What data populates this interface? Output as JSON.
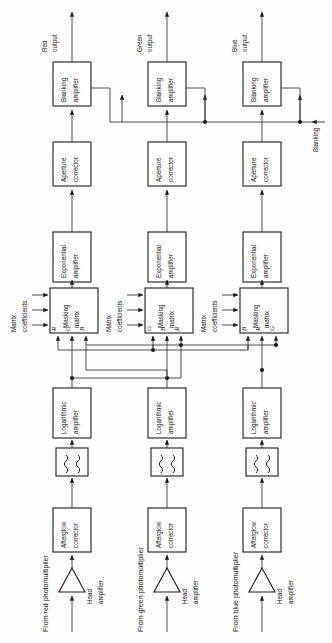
{
  "diagram": {
    "orientation": "rotated-90-ccw",
    "outputs": [
      {
        "id": "red",
        "label_line1": "Red",
        "label_line2": "output"
      },
      {
        "id": "green",
        "label_line1": "Green",
        "label_line2": "output"
      },
      {
        "id": "blue",
        "label_line1": "Blue",
        "label_line2": "output"
      }
    ],
    "blanking_label": "Blanking",
    "blocks": {
      "blanking_amplifier": {
        "line1": "Blanking",
        "line2": "amplifier"
      },
      "aperture_corrector": {
        "line1": "Aperture",
        "line2": "corrector"
      },
      "exponential_amplifier": {
        "line1": "Exponential",
        "line2": "amplifier"
      },
      "masking_matrix": {
        "line1": "Masking",
        "line2": "matrix"
      },
      "logarithmic_amplifier": {
        "line1": "Logarithmic",
        "line2": "amplifier"
      },
      "afterglow_corrector": {
        "line1": "Afterglow",
        "line2": "corrector"
      },
      "head_amplifier": {
        "line1": "Head",
        "line2": "amplifier"
      },
      "delay_filter": {
        "symbol": "squiggle-pair"
      }
    },
    "matrix_coefficients_label": {
      "line1": "Matrix",
      "line2": "coefficients"
    },
    "matrix_inputs": {
      "red_chain": [
        "R",
        "G",
        "B"
      ],
      "green_chain": [
        "G",
        "B",
        "R"
      ],
      "blue_chain": [
        "B",
        "R",
        "G"
      ]
    },
    "sources": [
      {
        "id": "red",
        "label": "From red photomultiplier"
      },
      {
        "id": "green",
        "label": "From green photomultiplier"
      },
      {
        "id": "blue",
        "label": "From blue photomultiplier"
      }
    ],
    "columns": [
      {
        "id": "red",
        "x": 72
      },
      {
        "id": "green",
        "x": 167
      },
      {
        "id": "blue",
        "x": 262
      }
    ],
    "colors": {
      "line": "#3b3b3b",
      "box_stroke": "#1a1a1a",
      "background": "#ffffff",
      "text": "#111111"
    }
  }
}
